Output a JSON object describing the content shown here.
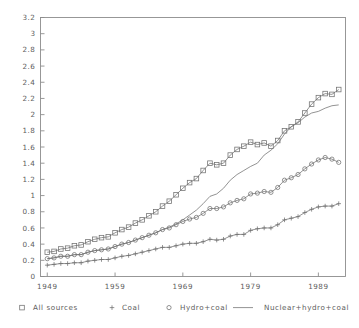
{
  "chart_data": {
    "type": "line",
    "title": "",
    "subtitle": "",
    "xlabel": "",
    "ylabel": "",
    "xlim": [
      1948,
      1993
    ],
    "ylim": [
      0,
      3.2
    ],
    "grid": false,
    "legend_position": "bottom",
    "x_ticks": [
      "1949",
      "1959",
      "1969",
      "1979",
      "1989"
    ],
    "x_tick_values": [
      1949,
      1959,
      1969,
      1979,
      1989
    ],
    "y_ticks": [
      "0",
      "0.2",
      "0.4",
      "0.6",
      "0.8",
      "1",
      "1.2",
      "1.4",
      "1.6",
      "1.8",
      "2",
      "2.2",
      "2.4",
      "2.6",
      "2.8",
      "3",
      "3.2"
    ],
    "y_tick_values": [
      0,
      0.2,
      0.4,
      0.6,
      0.8,
      1,
      1.2,
      1.4,
      1.6,
      1.8,
      2,
      2.2,
      2.4,
      2.6,
      2.8,
      3,
      3.2
    ],
    "x": [
      1949,
      1950,
      1951,
      1952,
      1953,
      1954,
      1955,
      1956,
      1957,
      1958,
      1959,
      1960,
      1961,
      1962,
      1963,
      1964,
      1965,
      1966,
      1967,
      1968,
      1969,
      1970,
      1971,
      1972,
      1973,
      1974,
      1975,
      1976,
      1977,
      1978,
      1979,
      1980,
      1981,
      1982,
      1983,
      1984,
      1985,
      1986,
      1987,
      1988,
      1989,
      1990,
      1991,
      1992
    ],
    "series": [
      {
        "name": "All sources",
        "marker": "square",
        "style": "marker-line",
        "values": [
          0.3,
          0.31,
          0.34,
          0.35,
          0.38,
          0.39,
          0.43,
          0.46,
          0.48,
          0.49,
          0.54,
          0.58,
          0.61,
          0.66,
          0.7,
          0.75,
          0.8,
          0.87,
          0.93,
          1.01,
          1.09,
          1.16,
          1.21,
          1.31,
          1.4,
          1.38,
          1.4,
          1.5,
          1.57,
          1.61,
          1.66,
          1.63,
          1.65,
          1.61,
          1.68,
          1.8,
          1.85,
          1.91,
          2.02,
          2.13,
          2.21,
          2.26,
          2.25,
          2.31
        ]
      },
      {
        "name": "Coal",
        "marker": "plus",
        "style": "marker-line",
        "values": [
          0.14,
          0.15,
          0.16,
          0.16,
          0.17,
          0.17,
          0.19,
          0.2,
          0.21,
          0.21,
          0.23,
          0.25,
          0.26,
          0.28,
          0.3,
          0.32,
          0.34,
          0.36,
          0.36,
          0.38,
          0.4,
          0.41,
          0.41,
          0.43,
          0.46,
          0.45,
          0.46,
          0.5,
          0.52,
          0.52,
          0.57,
          0.59,
          0.6,
          0.6,
          0.64,
          0.7,
          0.72,
          0.74,
          0.79,
          0.83,
          0.86,
          0.87,
          0.87,
          0.9
        ]
      },
      {
        "name": "Hydro+coal",
        "marker": "circle",
        "style": "marker-line",
        "values": [
          0.22,
          0.23,
          0.25,
          0.25,
          0.27,
          0.27,
          0.3,
          0.32,
          0.33,
          0.34,
          0.37,
          0.4,
          0.42,
          0.45,
          0.48,
          0.51,
          0.54,
          0.58,
          0.6,
          0.64,
          0.68,
          0.71,
          0.73,
          0.78,
          0.84,
          0.84,
          0.86,
          0.91,
          0.94,
          0.96,
          1.02,
          1.03,
          1.05,
          1.04,
          1.1,
          1.19,
          1.22,
          1.26,
          1.33,
          1.39,
          1.44,
          1.47,
          1.45,
          1.41
        ]
      },
      {
        "name": "Nuclear+hydro+coal",
        "marker": "none",
        "style": "line",
        "values": [
          0.22,
          0.23,
          0.25,
          0.25,
          0.27,
          0.27,
          0.3,
          0.32,
          0.33,
          0.34,
          0.37,
          0.4,
          0.42,
          0.45,
          0.48,
          0.51,
          0.54,
          0.58,
          0.61,
          0.65,
          0.7,
          0.76,
          0.82,
          0.9,
          0.99,
          1.02,
          1.09,
          1.19,
          1.26,
          1.31,
          1.36,
          1.4,
          1.5,
          1.56,
          1.64,
          1.76,
          1.85,
          1.9,
          1.97,
          2.02,
          2.04,
          2.08,
          2.11,
          2.12
        ]
      }
    ],
    "legend": [
      {
        "label": "All sources",
        "marker": "square"
      },
      {
        "label": "Coal",
        "marker": "plus"
      },
      {
        "label": "Hydro+coal",
        "marker": "circle"
      },
      {
        "label": "Nuclear+hydro+coal",
        "marker": "line"
      }
    ],
    "colors": {
      "axis": "#8d8d8d",
      "series": "#6f6f6f",
      "text": "#5d5d5d",
      "background": "#ffffff"
    }
  }
}
